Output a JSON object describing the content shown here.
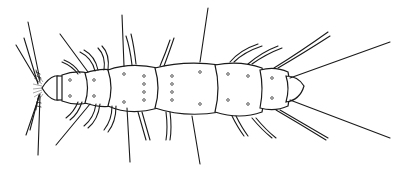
{
  "illustration": {
    "subject": "arthropod line drawing (dorsal view)",
    "background": "#ffffff",
    "stroke_color": "#1a1a1a"
  }
}
